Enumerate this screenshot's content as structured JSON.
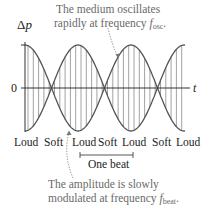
{
  "diagram": {
    "type": "beats-waveform",
    "y_axis_label": "Δp",
    "y_axis_symbol": "Δ",
    "y_axis_var": "p",
    "x_axis_label": "t",
    "zero_label": "0",
    "annotation_top": {
      "line1": "The medium oscillates",
      "line2_prefix": "rapidly at frequency ",
      "line2_var": "f",
      "line2_sub": "osc",
      "line2_suffix": "."
    },
    "annotation_bottom": {
      "line1": "The amplitude is slowly",
      "line2_prefix": "modulated at frequency ",
      "line2_var": "f",
      "line2_sub": "beat",
      "line2_suffix": "."
    },
    "loudness_labels": [
      "Loud",
      "Soft",
      "Loud",
      "Soft",
      "Loud",
      "Soft",
      "Loud"
    ],
    "beat_label": "One beat",
    "colors": {
      "envelope": "#555555",
      "oscillation": "#8a8a8a",
      "axis": "#333333",
      "annotation_text": "#6a6a6a",
      "label_text": "#222222"
    }
  }
}
